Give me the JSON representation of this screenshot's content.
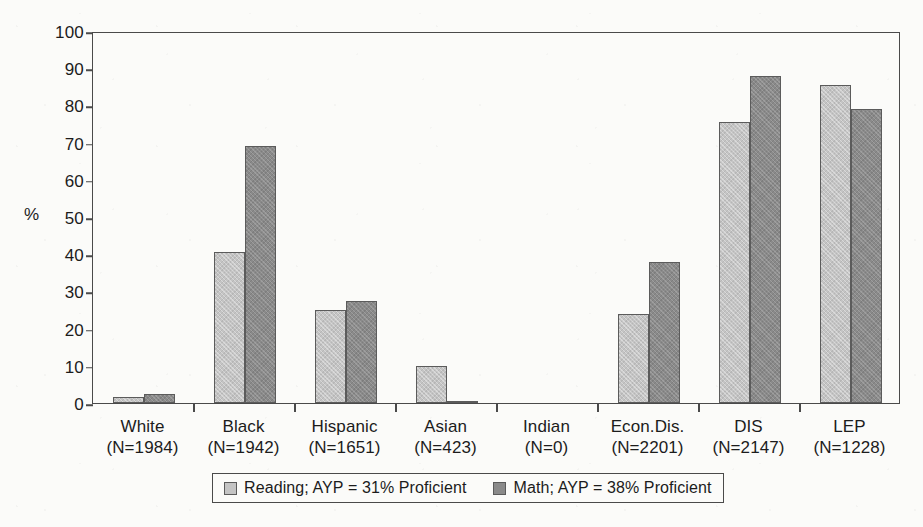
{
  "chart_data": {
    "type": "bar",
    "title": "",
    "xlabel": "",
    "ylabel": "%",
    "ylim": [
      0,
      100
    ],
    "yticks": [
      0,
      10,
      20,
      30,
      40,
      50,
      60,
      70,
      80,
      90,
      100
    ],
    "grid": false,
    "legend_position": "bottom",
    "categories": [
      "White",
      "Black",
      "Hispanic",
      "Asian",
      "Indian",
      "Econ.Dis.",
      "DIS",
      "LEP"
    ],
    "category_sublabels": [
      "(N=1984)",
      "(N=1942)",
      "(N=1651)",
      "(N=423)",
      "(N=0)",
      "(N=2201)",
      "(N=2147)",
      "(N=1228)"
    ],
    "series": [
      {
        "name": "Reading; AYP = 31% Proficient",
        "short_name": "Reading",
        "color": "#c4c4c4",
        "values": [
          1.5,
          40.5,
          25,
          10,
          0,
          24,
          75.5,
          85.5
        ]
      },
      {
        "name": "Math; AYP = 38% Proficient",
        "short_name": "Math",
        "color": "#8a8a8a",
        "values": [
          2.5,
          69,
          27.5,
          0.5,
          0,
          38,
          88,
          79
        ]
      }
    ]
  },
  "axis": {
    "y_title": "%"
  },
  "legend": {
    "entries": [
      "Reading; AYP = 31% Proficient",
      "Math; AYP = 38% Proficient"
    ]
  },
  "colors": {
    "reading": "#c4c4c4",
    "math": "#8a8a8a",
    "axis": "#4a4a4a",
    "background": "#fbfbf9"
  }
}
